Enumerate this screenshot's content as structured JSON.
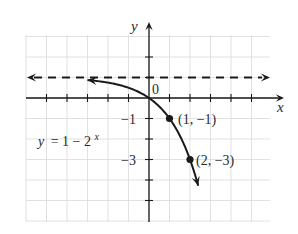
{
  "chart_data": {
    "type": "line",
    "title": "",
    "equation": "y = 1 − 2^x",
    "equation_parts": {
      "lhs": "y",
      "eq": "= 1 − 2",
      "exp": "x"
    },
    "xlabel": "x",
    "ylabel": "y",
    "origin_label": "0",
    "y_tick_labels": [
      {
        "value": -1,
        "label": "−1"
      },
      {
        "value": -3,
        "label": "−3"
      }
    ],
    "xlim": [
      -6,
      6
    ],
    "ylim": [
      -6,
      3
    ],
    "grid": true,
    "series": [
      {
        "name": "y = 1 − 2^x",
        "function": "1 - 2^x",
        "x_range": [
          -3,
          2.4
        ],
        "style": "solid",
        "arrows": "both"
      },
      {
        "name": "asymptote y = 1",
        "y": 1,
        "style": "dashed",
        "arrows": "both"
      }
    ],
    "points": [
      {
        "x": 1,
        "y": -1,
        "label": "(1, −1)"
      },
      {
        "x": 2,
        "y": -3,
        "label": "(2, −3)"
      }
    ]
  },
  "colors": {
    "ink": "#1a1a1a",
    "grid": "#d9d9d9",
    "text": "#2b2b2b"
  }
}
